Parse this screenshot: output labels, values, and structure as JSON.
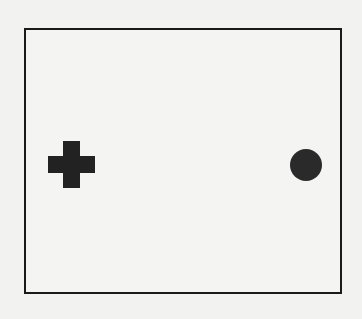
{
  "figure": {
    "type": "blind-spot-demonstration",
    "frame": {
      "x": 24,
      "y": 28,
      "width": 314,
      "height": 262,
      "border_color": "#1a1a1a"
    },
    "shapes": [
      {
        "kind": "cross",
        "name": "fixation-cross",
        "center_x": 71,
        "center_y": 164,
        "arm_length": 47,
        "arm_thickness": 17,
        "color": "#222222"
      },
      {
        "kind": "circle",
        "name": "target-dot",
        "center_x": 306,
        "center_y": 165,
        "radius": 16,
        "color": "#2a2a2a"
      }
    ],
    "background_color": "#f2f2f0"
  }
}
